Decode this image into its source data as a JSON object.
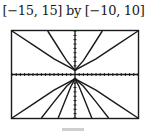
{
  "window": {
    "title": "[−15, 15] by [−10, 10]"
  },
  "chart_data": {
    "type": "line",
    "title": "[−15, 15] by [−10, 10]",
    "xlabel": "",
    "ylabel": "",
    "xlim": [
      -15,
      15
    ],
    "ylim": [
      -10,
      10
    ],
    "xscale_ticks": 1,
    "yscale_ticks": 1,
    "grid": false,
    "axes_visible": true,
    "series": [
      {
        "name": "upper-shallow",
        "x": [
          -15,
          -10,
          -5,
          0,
          5,
          10,
          15
        ],
        "y": [
          10,
          6.8,
          3.6,
          1,
          3.6,
          6.8,
          10
        ]
      },
      {
        "name": "upper-steep",
        "x": [
          -6.5,
          -4,
          -2,
          0,
          2,
          4,
          6.5
        ],
        "y": [
          10,
          6.2,
          3.2,
          1,
          3.2,
          6.2,
          10
        ]
      },
      {
        "name": "lower-shallow",
        "x": [
          -15,
          -10,
          -5,
          0,
          5,
          10,
          15
        ],
        "y": [
          -10,
          -6.8,
          -3.6,
          -1,
          -3.6,
          -6.8,
          -10
        ]
      },
      {
        "name": "lower-medium",
        "x": [
          -8,
          -5,
          -2,
          0,
          2,
          5,
          8
        ],
        "y": [
          -10,
          -6.3,
          -2.7,
          -1,
          -2.7,
          -6.3,
          -10
        ]
      },
      {
        "name": "lower-steep",
        "x": [
          -4,
          -2.5,
          -1,
          0,
          1,
          2.5,
          4
        ],
        "y": [
          -10,
          -6.4,
          -2.8,
          -1,
          -2.8,
          -6.4,
          -10
        ]
      }
    ]
  },
  "caption": {
    "visible_text": ""
  }
}
